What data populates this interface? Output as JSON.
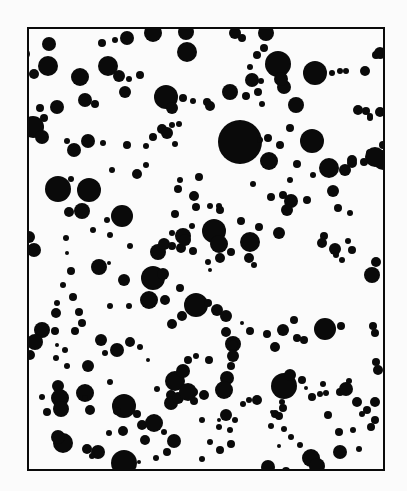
{
  "figure": {
    "background": "#fbfbfb",
    "ink": "#0a0a0a",
    "frame": {
      "x": 28,
      "y": 28,
      "width": 356,
      "height": 442,
      "stroke_width": 2
    },
    "dots": [
      [
        49,
        44,
        7
      ],
      [
        48,
        66,
        10
      ],
      [
        34,
        74,
        5
      ],
      [
        24,
        54,
        6
      ],
      [
        102,
        43,
        4
      ],
      [
        115,
        40,
        3
      ],
      [
        127,
        38,
        7
      ],
      [
        153,
        33,
        9
      ],
      [
        186,
        32,
        8
      ],
      [
        187,
        52,
        10
      ],
      [
        235,
        33,
        6
      ],
      [
        242,
        38,
        4
      ],
      [
        266,
        33,
        8
      ],
      [
        278,
        64,
        13
      ],
      [
        264,
        48,
        4
      ],
      [
        257,
        55,
        4
      ],
      [
        250,
        67,
        3
      ],
      [
        108,
        66,
        10
      ],
      [
        119,
        76,
        6
      ],
      [
        129,
        79,
        3
      ],
      [
        140,
        75,
        4
      ],
      [
        80,
        77,
        9
      ],
      [
        125,
        92,
        6
      ],
      [
        85,
        100,
        7
      ],
      [
        95,
        104,
        4
      ],
      [
        57,
        107,
        7
      ],
      [
        40,
        108,
        4
      ],
      [
        44,
        118,
        4
      ],
      [
        33,
        127,
        11
      ],
      [
        42,
        137,
        7
      ],
      [
        166,
        97,
        12
      ],
      [
        172,
        108,
        6
      ],
      [
        183,
        98,
        4
      ],
      [
        193,
        101,
        3
      ],
      [
        207,
        102,
        4
      ],
      [
        210,
        106,
        5
      ],
      [
        153,
        137,
        4
      ],
      [
        162,
        129,
        5
      ],
      [
        167,
        133,
        6
      ],
      [
        172,
        125,
        3
      ],
      [
        179,
        124,
        3
      ],
      [
        175,
        144,
        3
      ],
      [
        67,
        141,
        3
      ],
      [
        74,
        150,
        7
      ],
      [
        88,
        141,
        7
      ],
      [
        103,
        143,
        3
      ],
      [
        127,
        145,
        4
      ],
      [
        146,
        146,
        3
      ],
      [
        230,
        92,
        8
      ],
      [
        252,
        80,
        7
      ],
      [
        246,
        96,
        4
      ],
      [
        258,
        92,
        4
      ],
      [
        261,
        81,
        3
      ],
      [
        262,
        104,
        3
      ],
      [
        284,
        87,
        7
      ],
      [
        296,
        105,
        8
      ],
      [
        281,
        79,
        7
      ],
      [
        315,
        73,
        12
      ],
      [
        332,
        73,
        3
      ],
      [
        340,
        71,
        3
      ],
      [
        346,
        71,
        3
      ],
      [
        365,
        71,
        5
      ],
      [
        376,
        55,
        4
      ],
      [
        380,
        53,
        6
      ],
      [
        228,
        141,
        5
      ],
      [
        240,
        142,
        22
      ],
      [
        260,
        140,
        3
      ],
      [
        268,
        138,
        4
      ],
      [
        290,
        128,
        4
      ],
      [
        306,
        138,
        3
      ],
      [
        312,
        141,
        12
      ],
      [
        370,
        118,
        3
      ],
      [
        366,
        111,
        4
      ],
      [
        358,
        110,
        5
      ],
      [
        370,
        116,
        3
      ],
      [
        380,
        112,
        5
      ],
      [
        370,
        153,
        4
      ],
      [
        383,
        160,
        10
      ],
      [
        352,
        160,
        5
      ],
      [
        146,
        165,
        3
      ],
      [
        137,
        174,
        5
      ],
      [
        112,
        170,
        3
      ],
      [
        89,
        190,
        12
      ],
      [
        58,
        189,
        13
      ],
      [
        69,
        212,
        5
      ],
      [
        82,
        211,
        8
      ],
      [
        71,
        179,
        3
      ],
      [
        180,
        180,
        3
      ],
      [
        178,
        189,
        4
      ],
      [
        194,
        196,
        5
      ],
      [
        199,
        177,
        4
      ],
      [
        175,
        214,
        4
      ],
      [
        172,
        233,
        3
      ],
      [
        183,
        236,
        8
      ],
      [
        192,
        226,
        3
      ],
      [
        219,
        206,
        3
      ],
      [
        269,
        161,
        9
      ],
      [
        280,
        145,
        4
      ],
      [
        290,
        180,
        3
      ],
      [
        297,
        164,
        4
      ],
      [
        313,
        175,
        3
      ],
      [
        196,
        207,
        4
      ],
      [
        210,
        206,
        3
      ],
      [
        220,
        210,
        4
      ],
      [
        253,
        184,
        3
      ],
      [
        271,
        197,
        4
      ],
      [
        283,
        195,
        4
      ],
      [
        291,
        201,
        7
      ],
      [
        307,
        200,
        4
      ],
      [
        329,
        168,
        10
      ],
      [
        345,
        170,
        6
      ],
      [
        352,
        163,
        5
      ],
      [
        375,
        157,
        10
      ],
      [
        383,
        145,
        4
      ],
      [
        364,
        162,
        4
      ],
      [
        259,
        227,
        4
      ],
      [
        279,
        233,
        6
      ],
      [
        287,
        210,
        6
      ],
      [
        333,
        191,
        6
      ],
      [
        338,
        208,
        4
      ],
      [
        350,
        213,
        3
      ],
      [
        214,
        231,
        12
      ],
      [
        219,
        244,
        9
      ],
      [
        241,
        221,
        4
      ],
      [
        122,
        216,
        11
      ],
      [
        107,
        220,
        3
      ],
      [
        93,
        230,
        3
      ],
      [
        110,
        235,
        3
      ],
      [
        29,
        237,
        6
      ],
      [
        34,
        250,
        7
      ],
      [
        66,
        238,
        3
      ],
      [
        67,
        253,
        2
      ],
      [
        130,
        246,
        3
      ],
      [
        158,
        252,
        8
      ],
      [
        164,
        244,
        6
      ],
      [
        172,
        246,
        4
      ],
      [
        181,
        248,
        5
      ],
      [
        185,
        240,
        6
      ],
      [
        193,
        251,
        4
      ],
      [
        220,
        258,
        5
      ],
      [
        231,
        252,
        4
      ],
      [
        208,
        262,
        3
      ],
      [
        210,
        270,
        2
      ],
      [
        246,
        237,
        3
      ],
      [
        250,
        242,
        10
      ],
      [
        249,
        258,
        5
      ],
      [
        254,
        265,
        3
      ],
      [
        322,
        243,
        5
      ],
      [
        324,
        236,
        4
      ],
      [
        335,
        249,
        6
      ],
      [
        336,
        255,
        3
      ],
      [
        348,
        241,
        3
      ],
      [
        352,
        250,
        4
      ],
      [
        342,
        260,
        3
      ],
      [
        372,
        275,
        8
      ],
      [
        376,
        262,
        5
      ],
      [
        99,
        267,
        8
      ],
      [
        109,
        263,
        2
      ],
      [
        124,
        280,
        6
      ],
      [
        153,
        278,
        12
      ],
      [
        163,
        274,
        6
      ],
      [
        149,
        300,
        9
      ],
      [
        165,
        300,
        5
      ],
      [
        180,
        288,
        4
      ],
      [
        129,
        306,
        3
      ],
      [
        172,
        324,
        5
      ],
      [
        110,
        306,
        3
      ],
      [
        73,
        297,
        4
      ],
      [
        79,
        312,
        4
      ],
      [
        82,
        323,
        4
      ],
      [
        75,
        331,
        4
      ],
      [
        63,
        285,
        3
      ],
      [
        57,
        303,
        3
      ],
      [
        71,
        271,
        4
      ],
      [
        56,
        313,
        5
      ],
      [
        55,
        331,
        4
      ],
      [
        42,
        330,
        8
      ],
      [
        35,
        342,
        8
      ],
      [
        30,
        355,
        5
      ],
      [
        182,
        316,
        5
      ],
      [
        196,
        305,
        12
      ],
      [
        208,
        303,
        4
      ],
      [
        217,
        310,
        6
      ],
      [
        226,
        316,
        6
      ],
      [
        226,
        332,
        5
      ],
      [
        233,
        344,
        8
      ],
      [
        233,
        345,
        5
      ],
      [
        242,
        323,
        2
      ],
      [
        250,
        331,
        4
      ],
      [
        267,
        334,
        4
      ],
      [
        275,
        347,
        5
      ],
      [
        283,
        330,
        6
      ],
      [
        294,
        320,
        4
      ],
      [
        297,
        338,
        4
      ],
      [
        304,
        340,
        4
      ],
      [
        325,
        329,
        11
      ],
      [
        341,
        326,
        4
      ],
      [
        373,
        326,
        4
      ],
      [
        375,
        333,
        4
      ],
      [
        56,
        358,
        3
      ],
      [
        57,
        345,
        2
      ],
      [
        65,
        350,
        3
      ],
      [
        67,
        366,
        3
      ],
      [
        105,
        353,
        3
      ],
      [
        101,
        340,
        6
      ],
      [
        117,
        350,
        7
      ],
      [
        130,
        342,
        5
      ],
      [
        140,
        347,
        3
      ],
      [
        148,
        360,
        2
      ],
      [
        175,
        381,
        10
      ],
      [
        183,
        371,
        7
      ],
      [
        188,
        360,
        4
      ],
      [
        196,
        356,
        3
      ],
      [
        209,
        360,
        4
      ],
      [
        231,
        366,
        4
      ],
      [
        227,
        378,
        7
      ],
      [
        224,
        390,
        9
      ],
      [
        233,
        356,
        6
      ],
      [
        157,
        389,
        3
      ],
      [
        171,
        395,
        5
      ],
      [
        171,
        403,
        7
      ],
      [
        178,
        398,
        6
      ],
      [
        188,
        392,
        9
      ],
      [
        42,
        397,
        3
      ],
      [
        58,
        386,
        6
      ],
      [
        60,
        398,
        9
      ],
      [
        61,
        409,
        8
      ],
      [
        47,
        412,
        4
      ],
      [
        85,
        393,
        9
      ],
      [
        110,
        382,
        3
      ],
      [
        85,
        398,
        3
      ],
      [
        88,
        366,
        6
      ],
      [
        90,
        410,
        5
      ],
      [
        124,
        406,
        12
      ],
      [
        117,
        411,
        4
      ],
      [
        137,
        414,
        4
      ],
      [
        142,
        425,
        5
      ],
      [
        154,
        423,
        9
      ],
      [
        145,
        440,
        5
      ],
      [
        164,
        432,
        3
      ],
      [
        174,
        441,
        7
      ],
      [
        194,
        392,
        4
      ],
      [
        194,
        401,
        4
      ],
      [
        202,
        420,
        3
      ],
      [
        204,
        395,
        5
      ],
      [
        219,
        420,
        2
      ],
      [
        226,
        415,
        6
      ],
      [
        230,
        430,
        3
      ],
      [
        231,
        444,
        4
      ],
      [
        235,
        420,
        3
      ],
      [
        243,
        404,
        3
      ],
      [
        249,
        400,
        3
      ],
      [
        257,
        400,
        5
      ],
      [
        271,
        426,
        3
      ],
      [
        275,
        414,
        4
      ],
      [
        279,
        416,
        4
      ],
      [
        283,
        408,
        4
      ],
      [
        284,
        386,
        13
      ],
      [
        290,
        375,
        6
      ],
      [
        302,
        380,
        4
      ],
      [
        306,
        388,
        2
      ],
      [
        312,
        397,
        4
      ],
      [
        326,
        393,
        3
      ],
      [
        328,
        415,
        4
      ],
      [
        340,
        392,
        4
      ],
      [
        346,
        389,
        7
      ],
      [
        349,
        381,
        3
      ],
      [
        357,
        402,
        5
      ],
      [
        367,
        410,
        4
      ],
      [
        375,
        402,
        5
      ],
      [
        378,
        370,
        5
      ],
      [
        376,
        362,
        4
      ],
      [
        320,
        394,
        3
      ],
      [
        323,
        384,
        3
      ],
      [
        282,
        402,
        3
      ],
      [
        63,
        443,
        10
      ],
      [
        87,
        449,
        5
      ],
      [
        98,
        452,
        7
      ],
      [
        92,
        456,
        3
      ],
      [
        58,
        437,
        7
      ],
      [
        109,
        433,
        3
      ],
      [
        123,
        431,
        5
      ],
      [
        139,
        462,
        2
      ],
      [
        124,
        463,
        13
      ],
      [
        167,
        452,
        4
      ],
      [
        156,
        458,
        3
      ],
      [
        202,
        459,
        3
      ],
      [
        220,
        450,
        4
      ],
      [
        210,
        442,
        3
      ],
      [
        219,
        427,
        3
      ],
      [
        268,
        467,
        7
      ],
      [
        286,
        471,
        4
      ],
      [
        311,
        458,
        9
      ],
      [
        317,
        466,
        8
      ],
      [
        340,
        452,
        7
      ],
      [
        359,
        449,
        3
      ],
      [
        339,
        432,
        4
      ],
      [
        353,
        430,
        3
      ],
      [
        362,
        414,
        3
      ],
      [
        375,
        420,
        4
      ],
      [
        371,
        427,
        4
      ],
      [
        300,
        445,
        3
      ],
      [
        291,
        437,
        3
      ],
      [
        279,
        446,
        2
      ],
      [
        284,
        429,
        3
      ],
      [
        272,
        412,
        2
      ]
    ]
  }
}
